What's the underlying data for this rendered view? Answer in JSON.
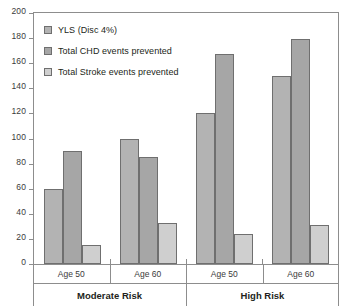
{
  "chart_data": {
    "type": "bar",
    "title": "",
    "subtitle": "",
    "xlabel": "",
    "ylabel": "",
    "ylim": [
      0,
      200
    ],
    "ytick_step": 20,
    "yticks": [
      "0",
      "20",
      "40",
      "60",
      "80",
      "100",
      "120",
      "140",
      "160",
      "180",
      "200"
    ],
    "grid": false,
    "legend_position": "top-left-inside",
    "orientation": "vertical",
    "categories": [
      "Age 50",
      "Age 60",
      "Age 50",
      "Age 60"
    ],
    "group_labels": [
      "Moderate Risk",
      "High Risk"
    ],
    "group_spans": [
      2,
      2
    ],
    "series": [
      {
        "name": "YLS (Disc 4%)",
        "color": "#b3b3b3",
        "values": [
          60,
          100,
          120,
          150
        ]
      },
      {
        "name": "Total CHD events prevented",
        "color": "#a6a6a6",
        "values": [
          90,
          85,
          167,
          179
        ]
      },
      {
        "name": "Total Stroke events prevented",
        "color": "#cfcfcf",
        "values": [
          15,
          33,
          24,
          31
        ]
      }
    ]
  },
  "axis": {
    "border_color": "#8d8d8d",
    "tick_color": "#8d8d8d",
    "label_color": "#3b3b3b"
  }
}
